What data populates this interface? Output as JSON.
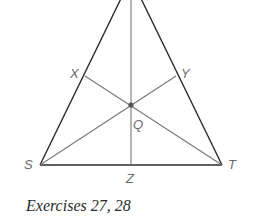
{
  "figure": {
    "caption": "Exercises 27, 28",
    "colors": {
      "side": "#2b2b2b",
      "median": "#777777",
      "centroid": "#555555",
      "label": "#6a6a6a",
      "caption": "#2a2a2a"
    },
    "points": {
      "S": {
        "label": "S",
        "x": 40,
        "y": 165
      },
      "T": {
        "label": "T",
        "x": 222,
        "y": 165
      },
      "Z": {
        "label": "Z",
        "x": 131,
        "y": 165
      },
      "X": {
        "label": "X",
        "x": 85,
        "y": 76
      },
      "Y": {
        "label": "Y",
        "x": 176,
        "y": 76
      },
      "Q": {
        "label": "Q",
        "x": 131,
        "y": 105
      }
    },
    "segments": [
      {
        "name": "side-apex-S",
        "from": "apex",
        "to": "S"
      },
      {
        "name": "side-apex-T",
        "from": "apex",
        "to": "T"
      },
      {
        "name": "side-S-T",
        "from": "S",
        "to": "T"
      },
      {
        "name": "median-apex-Z",
        "from": "apex",
        "to": "Z"
      },
      {
        "name": "median-S-Y",
        "from": "S",
        "to": "Y"
      },
      {
        "name": "median-T-X",
        "from": "T",
        "to": "X"
      }
    ]
  }
}
